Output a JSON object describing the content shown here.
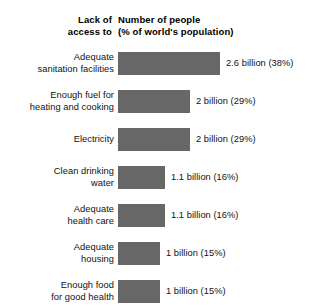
{
  "header": {
    "left_line1": "Lack of",
    "left_line2": "access to",
    "right_line1": "Number of people",
    "right_line2": "(% of world's population)"
  },
  "rows": [
    {
      "label_line1": "Adequate",
      "label_line2": "sanitation facilities",
      "value_label": "2.6 billion (38%)",
      "billions": 2.6,
      "percent": 38,
      "bar_px": 102
    },
    {
      "label_line1": "Enough fuel for",
      "label_line2": "heating and cooking",
      "value_label": "2 billion (29%)",
      "billions": 2,
      "percent": 29,
      "bar_px": 72
    },
    {
      "label_line1": "Electricity",
      "label_line2": "",
      "value_label": "2 billion (29%)",
      "billions": 2,
      "percent": 29,
      "bar_px": 72
    },
    {
      "label_line1": "Clean drinking",
      "label_line2": "water",
      "value_label": "1.1 billion (16%)",
      "billions": 1.1,
      "percent": 16,
      "bar_px": 47
    },
    {
      "label_line1": "Adequate",
      "label_line2": "health care",
      "value_label": "1.1 billion (16%)",
      "billions": 1.1,
      "percent": 16,
      "bar_px": 47
    },
    {
      "label_line1": "Adequate",
      "label_line2": "housing",
      "value_label": "1 billion (15%)",
      "billions": 1,
      "percent": 15,
      "bar_px": 42
    },
    {
      "label_line1": "Enough food",
      "label_line2": "for good health",
      "value_label": "1 billion (15%)",
      "billions": 1,
      "percent": 15,
      "bar_px": 42
    }
  ],
  "chart_data": {
    "type": "bar",
    "orientation": "horizontal",
    "title": "",
    "xlabel": "Number of people (% of world's population)",
    "ylabel": "Lack of access to",
    "grid": false,
    "legend": "none",
    "bar_color": "#676767",
    "background_color": "#ffffff",
    "categories": [
      "Adequate sanitation facilities",
      "Enough fuel for heating and cooking",
      "Electricity",
      "Clean drinking water",
      "Adequate health care",
      "Adequate housing",
      "Enough food for good health"
    ],
    "values": [
      2.6,
      2,
      2,
      1.1,
      1.1,
      1,
      1
    ],
    "value_unit": "billion people",
    "percent_of_world_population": [
      38,
      29,
      29,
      16,
      16,
      15,
      15
    ],
    "data_labels": [
      "2.6 billion (38%)",
      "2 billion (29%)",
      "2 billion (29%)",
      "1.1 billion (16%)",
      "1.1 billion (16%)",
      "1 billion (15%)",
      "1 billion (15%)"
    ],
    "xlim": [
      0,
      2.6
    ]
  }
}
